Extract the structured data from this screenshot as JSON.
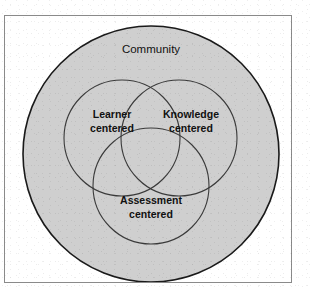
{
  "figure": {
    "top_caption": "",
    "background_color": "#ffffff",
    "frame_border_color": "#8a8a8a"
  },
  "diagram": {
    "type": "venn",
    "outer": {
      "label": "Community",
      "fill_color": "#cfcfcf",
      "stroke_color": "#1a1a1a",
      "cx": 146,
      "cy": 138,
      "r": 128
    },
    "circles": [
      {
        "id": "learner",
        "label_line1": "Learner",
        "label_line2": "centered",
        "cx": 117,
        "cy": 122,
        "r": 58,
        "stroke_color": "#3a3a3a"
      },
      {
        "id": "knowledge",
        "label_line1": "Knowledge",
        "label_line2": "centered",
        "cx": 174,
        "cy": 122,
        "r": 58,
        "stroke_color": "#3a3a3a"
      },
      {
        "id": "assessment",
        "label_line1": "Assessment",
        "label_line2": "centered",
        "cx": 146,
        "cy": 170,
        "r": 58,
        "stroke_color": "#3a3a3a"
      }
    ]
  }
}
